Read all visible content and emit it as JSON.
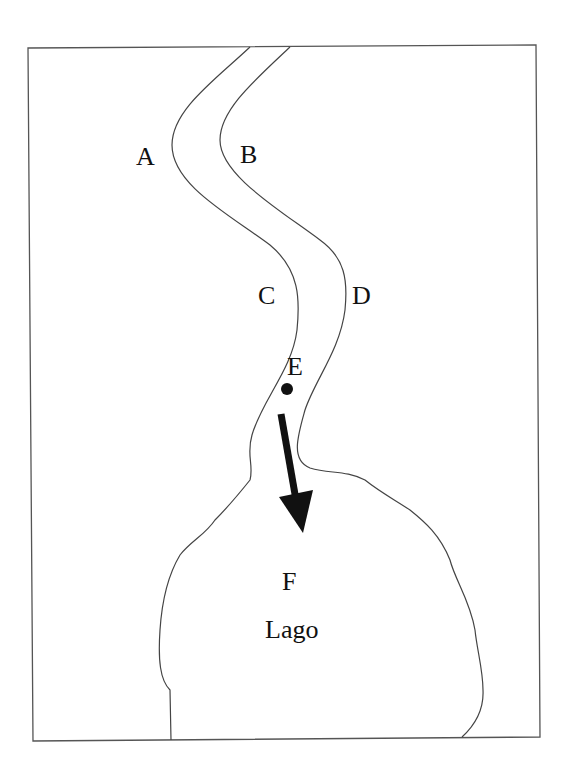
{
  "diagram": {
    "type": "river-to-lake map",
    "colors": {
      "line": "#444444",
      "ink": "#111111",
      "background": "#ffffff"
    },
    "labels": {
      "a": "A",
      "b": "B",
      "c": "C",
      "d": "D",
      "e": "E",
      "f": "F",
      "lake": "Lago"
    },
    "markers": {
      "point_e": {
        "name": "point-e",
        "shape": "dot"
      },
      "flow_arrow": {
        "name": "flow-direction",
        "direction": "toward lake"
      }
    }
  }
}
